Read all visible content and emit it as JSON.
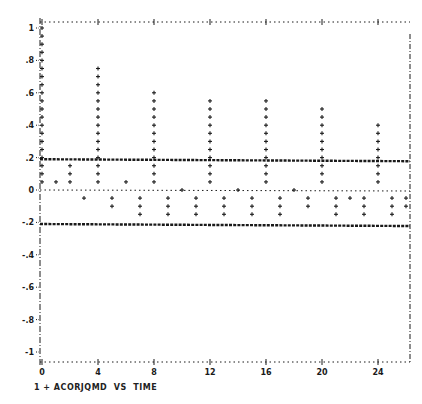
{
  "chart_data": {
    "type": "bar",
    "style": "line-printer autocorrelation plot (bars drawn as stacked + marks)",
    "title": "",
    "caption": "1 + ACORJQMD  VS  TIME",
    "series": [
      {
        "name": "ACORJQMD",
        "symbol": "+",
        "x": [
          0,
          1,
          2,
          3,
          4,
          5,
          6,
          7,
          8,
          9,
          10,
          11,
          12,
          13,
          14,
          15,
          16,
          17,
          18,
          19,
          20,
          21,
          22,
          23,
          24,
          25,
          26
        ],
        "values": [
          1.0,
          0.05,
          0.15,
          -0.05,
          0.75,
          -0.1,
          0.05,
          -0.15,
          0.6,
          -0.15,
          0.0,
          -0.15,
          0.55,
          -0.15,
          0.0,
          -0.15,
          0.55,
          -0.15,
          0.0,
          -0.1,
          0.5,
          -0.15,
          -0.05,
          -0.15,
          0.4,
          -0.15,
          -0.1
        ]
      }
    ],
    "reference_lines": [
      {
        "name": "upper-confidence-bound",
        "y": 0.19,
        "style": "heavy dashed"
      },
      {
        "name": "zero-line",
        "y": 0.0,
        "style": "dotted"
      },
      {
        "name": "lower-confidence-bound",
        "y": -0.21,
        "style": "heavy dashed"
      }
    ],
    "xlabel": "TIME",
    "ylabel": "ACORJQMD",
    "x_ticks": [
      "0",
      "4",
      "8",
      "12",
      "16",
      "20",
      "24"
    ],
    "y_ticks": [
      "1",
      ".8",
      ".6",
      ".4",
      ".2",
      "0",
      "-.2",
      "-.4",
      "-.6",
      "-.8",
      "-1"
    ],
    "xlim": [
      0,
      26
    ],
    "ylim": [
      -1,
      1
    ],
    "grid": false,
    "legend_position": "bottom-left caption"
  },
  "axis": {
    "x_tick_values": [
      0,
      4,
      8,
      12,
      16,
      20,
      24
    ],
    "y_tick_values": [
      1,
      0.8,
      0.6,
      0.4,
      0.2,
      0,
      -0.2,
      -0.4,
      -0.6,
      -0.8,
      -1
    ],
    "y_tick_labels": [
      "1",
      ".8",
      ".6",
      ".4",
      ".2",
      "0",
      "-.2",
      "-.4",
      "-.6",
      "-.8",
      "-1"
    ],
    "x_tick_labels": [
      "0",
      "4",
      "8",
      "12",
      "16",
      "20",
      "24"
    ]
  },
  "colors": {
    "ink": "#1a1a1a",
    "background": "#ffffff"
  }
}
